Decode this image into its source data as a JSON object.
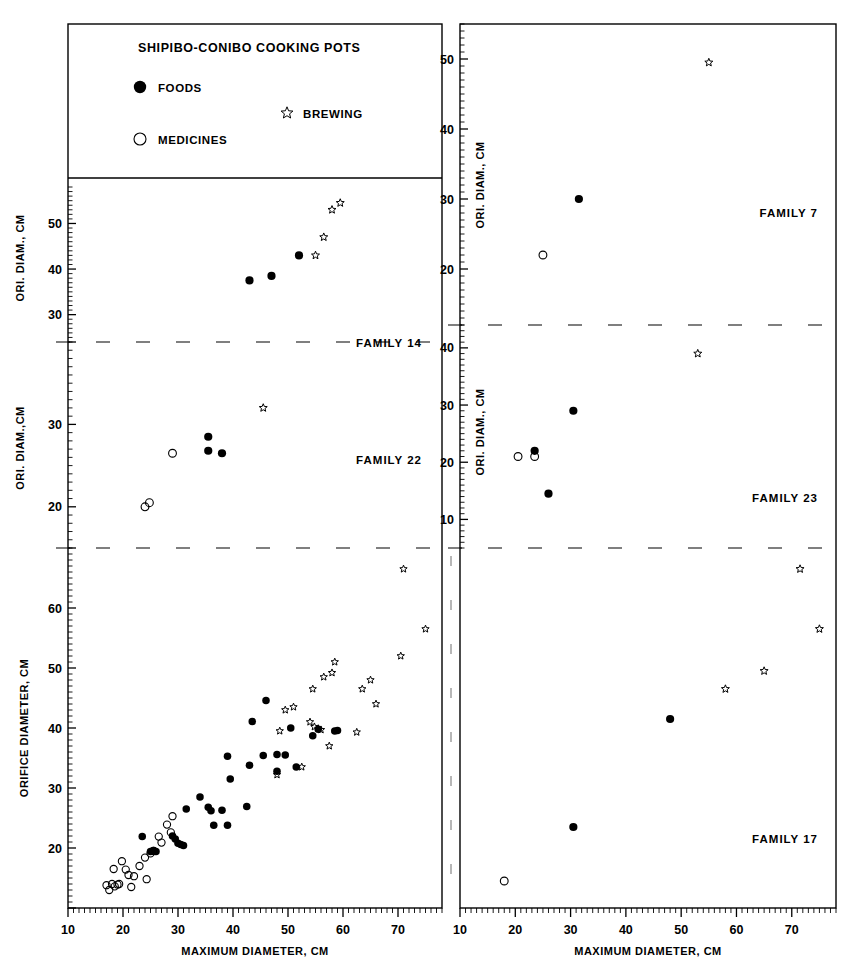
{
  "figure": {
    "title": "SHIPIBO-CONIBO COOKING POTS",
    "legend": [
      {
        "key": "foods",
        "label": "FOODS",
        "marker": "filled-circle"
      },
      {
        "key": "medicines",
        "label": "MEDICINES",
        "marker": "open-circle"
      },
      {
        "key": "brewing",
        "label": "BREWING",
        "marker": "open-star"
      }
    ],
    "caption_fragment": ""
  },
  "chart_data": [
    {
      "id": "family-14",
      "type": "scatter",
      "title": "FAMILY 14",
      "panel": "top-left",
      "xlabel": "",
      "ylabel": "ORI. DIAM., CM",
      "xlim": [
        10,
        78
      ],
      "ylim": [
        24,
        58
      ],
      "xticks": [
        20,
        30,
        40,
        50,
        60,
        70
      ],
      "yticks": [
        30,
        40,
        50
      ],
      "grid": false,
      "series": [
        {
          "name": "FOODS",
          "marker": "filled-circle",
          "points": [
            [
              43.0,
              37.5
            ],
            [
              47.0,
              38.5
            ],
            [
              52.0,
              43.0
            ]
          ]
        },
        {
          "name": "BREWING",
          "marker": "open-star",
          "points": [
            [
              55.0,
              43.0
            ],
            [
              56.5,
              47.0
            ],
            [
              58.0,
              53.0
            ],
            [
              59.5,
              54.5
            ]
          ]
        }
      ]
    },
    {
      "id": "family-7",
      "type": "scatter",
      "title": "FAMILY 7",
      "panel": "top-right",
      "xlabel": "",
      "ylabel": "ORI. DIAM., CM",
      "xlim": [
        10,
        78
      ],
      "ylim": [
        12,
        55
      ],
      "xticks": [
        20,
        30,
        40,
        50,
        60,
        70
      ],
      "yticks": [
        20,
        30,
        40,
        50
      ],
      "grid": false,
      "series": [
        {
          "name": "MEDICINES",
          "marker": "open-circle",
          "points": [
            [
              25.0,
              22.0
            ]
          ]
        },
        {
          "name": "FOODS",
          "marker": "filled-circle",
          "points": [
            [
              31.5,
              30.0
            ]
          ]
        },
        {
          "name": "BREWING",
          "marker": "open-star",
          "points": [
            [
              55.0,
              49.5
            ]
          ]
        }
      ]
    },
    {
      "id": "family-22",
      "type": "scatter",
      "title": "FAMILY 22",
      "panel": "middle-left",
      "xlabel": "",
      "ylabel": "ORI. DIAM.,CM",
      "xlim": [
        10,
        78
      ],
      "ylim": [
        15,
        40
      ],
      "xticks": [
        20,
        30,
        40,
        50,
        60,
        70
      ],
      "yticks": [
        20,
        30
      ],
      "grid": false,
      "series": [
        {
          "name": "MEDICINES",
          "marker": "open-circle",
          "points": [
            [
              29.0,
              26.5
            ],
            [
              24.0,
              20.0
            ],
            [
              24.8,
              20.5
            ]
          ]
        },
        {
          "name": "FOODS",
          "marker": "filled-circle",
          "points": [
            [
              35.5,
              28.5
            ],
            [
              35.5,
              26.8
            ],
            [
              38.0,
              26.5
            ]
          ]
        },
        {
          "name": "BREWING",
          "marker": "open-star",
          "points": [
            [
              45.5,
              32.0
            ]
          ]
        }
      ]
    },
    {
      "id": "family-23",
      "type": "scatter",
      "title": "FAMILY 23",
      "panel": "middle-right",
      "xlabel": "",
      "ylabel": "ORI. DIAM., CM",
      "xlim": [
        10,
        78
      ],
      "ylim": [
        5,
        44
      ],
      "xticks": [
        20,
        30,
        40,
        50,
        60,
        70
      ],
      "yticks": [
        10,
        20,
        30,
        40
      ],
      "grid": false,
      "series": [
        {
          "name": "MEDICINES",
          "marker": "open-circle",
          "points": [
            [
              20.5,
              21.0
            ],
            [
              23.5,
              21.0
            ]
          ]
        },
        {
          "name": "FOODS",
          "marker": "filled-circle",
          "points": [
            [
              23.5,
              22.0
            ],
            [
              26.0,
              14.5
            ],
            [
              30.5,
              29.0
            ]
          ]
        },
        {
          "name": "BREWING",
          "marker": "open-star",
          "points": [
            [
              53.0,
              39.0
            ]
          ]
        }
      ]
    },
    {
      "id": "all-families",
      "type": "scatter",
      "title": "",
      "panel": "bottom-left",
      "xlabel": "MAXIMUM DIAMETER, CM",
      "ylabel": "ORIFICE DIAMETER, CM",
      "xlim": [
        10,
        78
      ],
      "ylim": [
        10,
        70
      ],
      "xticks": [
        10,
        20,
        30,
        40,
        50,
        60,
        70
      ],
      "yticks": [
        20,
        30,
        40,
        50,
        60
      ],
      "grid": false,
      "series": [
        {
          "name": "MEDICINES",
          "marker": "open-circle",
          "points": [
            [
              17.0,
              13.8
            ],
            [
              17.5,
              13.0
            ],
            [
              18.0,
              14.0
            ],
            [
              18.5,
              13.6
            ],
            [
              19.0,
              13.9
            ],
            [
              19.3,
              14.0
            ],
            [
              18.3,
              16.5
            ],
            [
              19.8,
              17.8
            ],
            [
              20.5,
              16.4
            ],
            [
              21.0,
              15.5
            ],
            [
              21.5,
              13.5
            ],
            [
              22.0,
              15.3
            ],
            [
              23.0,
              17.0
            ],
            [
              24.0,
              18.4
            ],
            [
              25.0,
              19.1
            ],
            [
              25.6,
              19.5
            ],
            [
              24.3,
              14.8
            ],
            [
              26.5,
              21.9
            ],
            [
              27.0,
              20.9
            ],
            [
              28.0,
              23.9
            ],
            [
              29.0,
              25.3
            ],
            [
              28.7,
              22.6
            ]
          ]
        },
        {
          "name": "FOODS",
          "marker": "filled-circle",
          "points": [
            [
              23.5,
              21.9
            ],
            [
              25.0,
              19.4
            ],
            [
              25.5,
              19.6
            ],
            [
              26.0,
              19.4
            ],
            [
              29.0,
              22.0
            ],
            [
              29.5,
              21.5
            ],
            [
              30.0,
              20.8
            ],
            [
              30.5,
              20.6
            ],
            [
              31.0,
              20.4
            ],
            [
              31.5,
              26.5
            ],
            [
              34.0,
              28.5
            ],
            [
              35.5,
              26.8
            ],
            [
              36.0,
              26.2
            ],
            [
              36.5,
              23.8
            ],
            [
              38.0,
              26.3
            ],
            [
              39.0,
              23.8
            ],
            [
              39.5,
              31.5
            ],
            [
              39.0,
              35.3
            ],
            [
              42.5,
              26.9
            ],
            [
              43.0,
              33.8
            ],
            [
              43.5,
              41.1
            ],
            [
              45.5,
              35.4
            ],
            [
              46.0,
              44.6
            ],
            [
              48.0,
              35.6
            ],
            [
              48.0,
              32.8
            ],
            [
              49.5,
              35.5
            ],
            [
              50.5,
              40.0
            ],
            [
              51.5,
              33.5
            ],
            [
              54.5,
              38.7
            ],
            [
              55.5,
              39.8
            ],
            [
              58.5,
              39.5
            ],
            [
              59.0,
              39.6
            ]
          ]
        },
        {
          "name": "BREWING",
          "marker": "open-star",
          "points": [
            [
              48.0,
              32.2
            ],
            [
              48.5,
              39.5
            ],
            [
              49.5,
              43.0
            ],
            [
              51.0,
              43.5
            ],
            [
              52.5,
              33.5
            ],
            [
              54.0,
              41.0
            ],
            [
              54.5,
              46.5
            ],
            [
              54.8,
              40.2
            ],
            [
              55.5,
              39.9
            ],
            [
              56.0,
              39.7
            ],
            [
              56.5,
              48.5
            ],
            [
              57.5,
              37.0
            ],
            [
              58.5,
              51.0
            ],
            [
              58.0,
              49.2
            ],
            [
              62.5,
              39.3
            ],
            [
              63.5,
              46.5
            ],
            [
              65.0,
              48.0
            ],
            [
              66.0,
              44.0
            ],
            [
              71.0,
              66.5
            ],
            [
              70.5,
              52.0
            ],
            [
              75.0,
              56.5
            ]
          ]
        }
      ]
    },
    {
      "id": "family-17",
      "type": "scatter",
      "title": "FAMILY 17",
      "panel": "bottom-right",
      "xlabel": "MAXIMUM DIAMETER, CM",
      "ylabel": "",
      "xlim": [
        10,
        78
      ],
      "ylim": [
        10,
        70
      ],
      "xticks": [
        10,
        20,
        30,
        40,
        50,
        60,
        70
      ],
      "yticks": [],
      "grid": false,
      "series": [
        {
          "name": "MEDICINES",
          "marker": "open-circle",
          "points": [
            [
              18.0,
              14.5
            ]
          ]
        },
        {
          "name": "FOODS",
          "marker": "filled-circle",
          "points": [
            [
              30.5,
              23.5
            ],
            [
              48.0,
              41.5
            ]
          ]
        },
        {
          "name": "BREWING",
          "marker": "open-star",
          "points": [
            [
              58.0,
              46.5
            ],
            [
              65.0,
              49.5
            ],
            [
              71.5,
              66.5
            ],
            [
              75.0,
              56.5
            ]
          ]
        }
      ]
    }
  ],
  "colors": {
    "ink": "#000000",
    "paper": "#ffffff",
    "dash": "#888888"
  }
}
